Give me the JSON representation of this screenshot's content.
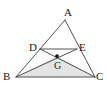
{
  "figure": {
    "type": "geometry-diagram",
    "background_color": "#ffffff",
    "stroke_color": "#3f3f3f",
    "shaded_fill_color": "#e4e4e4",
    "point_color": "#111111",
    "label_color": "#1a1a1a",
    "canvas": {
      "width": 107,
      "height": 94
    }
  },
  "labels": {
    "A": "A",
    "B": "B",
    "C": "C",
    "D": "D",
    "E": "E",
    "G": "G"
  },
  "chart_data": {
    "type": "scatter",
    "xlabel": "",
    "ylabel": "",
    "grid": false,
    "legend": "none",
    "xlim": [
      0,
      107
    ],
    "ylim": [
      0,
      94
    ],
    "points": [
      {
        "name": "A",
        "x": 65,
        "y": 20,
        "label": "A",
        "label_x": 64,
        "label_y": 7,
        "dot": false
      },
      {
        "name": "B",
        "x": 16,
        "y": 77,
        "label": "B",
        "label_x": 3,
        "label_y": 71,
        "dot": false
      },
      {
        "name": "C",
        "x": 95,
        "y": 77,
        "label": "C",
        "label_x": 96,
        "label_y": 71,
        "dot": false
      },
      {
        "name": "D",
        "x": 40,
        "y": 49,
        "label": "D",
        "label_x": 29,
        "label_y": 42,
        "dot": false
      },
      {
        "name": "E",
        "x": 77,
        "y": 49,
        "label": "E",
        "label_x": 79,
        "label_y": 42,
        "dot": false
      },
      {
        "name": "G",
        "x": 57,
        "y": 56,
        "label": "G",
        "label_x": 54,
        "label_y": 61,
        "dot": true
      }
    ],
    "segments": [
      {
        "name": "AB",
        "from": "A",
        "to": "B"
      },
      {
        "name": "AC",
        "from": "A",
        "to": "C"
      },
      {
        "name": "BC",
        "from": "B",
        "to": "C"
      },
      {
        "name": "DE",
        "from": "D",
        "to": "E"
      },
      {
        "name": "DC",
        "from": "D",
        "to": "C"
      },
      {
        "name": "EB",
        "from": "E",
        "to": "B"
      }
    ],
    "shaded_regions": [
      {
        "name": "triangle-BGC",
        "vertices": [
          "B",
          "G",
          "C"
        ],
        "fill": "#e4e4e4"
      }
    ]
  }
}
